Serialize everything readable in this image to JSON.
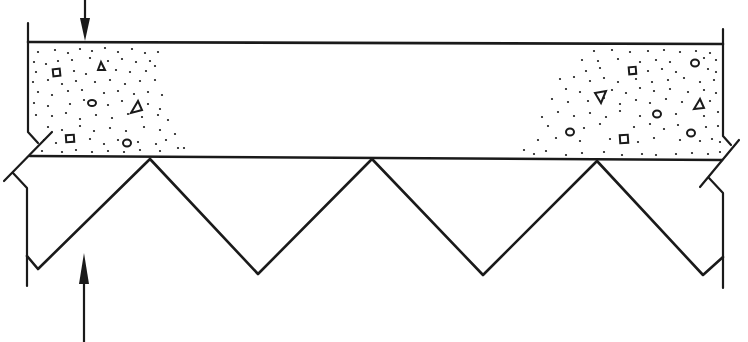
{
  "diagram": {
    "type": "composite-slab-section",
    "colors": {
      "ink": "#1a1a1a",
      "background": "#ffffff"
    },
    "slab": {
      "top_y": 42,
      "bottom_y": 158,
      "left_x": 28,
      "right_x": 723
    },
    "deck_profile_points": [
      [
        28,
        262
      ],
      [
        38,
        269
      ],
      [
        150,
        159
      ],
      [
        258,
        274
      ],
      [
        372,
        159
      ],
      [
        483,
        275
      ],
      [
        597,
        161
      ],
      [
        703,
        275
      ],
      [
        723,
        257
      ]
    ],
    "load_arrow": {
      "x": 85,
      "tail_y": 0,
      "head_y": 42,
      "direction": "down"
    },
    "reaction_arrow": {
      "x": 84,
      "tail_y": 342,
      "head_y": 253,
      "direction": "up"
    },
    "labels": []
  }
}
